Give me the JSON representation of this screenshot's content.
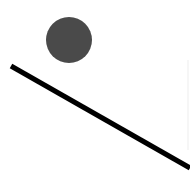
{
  "diagram": {
    "type": "ball-on-incline",
    "width": 190,
    "height": 195,
    "background": "#ffffff",
    "ball": {
      "cx": 69,
      "cy": 40,
      "r": 23,
      "color": "#4a4a4a"
    },
    "incline": {
      "x1": 11,
      "y1": 66,
      "x2": 190,
      "y2": 168,
      "stroke": "#000000",
      "stroke_width": 5
    },
    "edge_mark": {
      "x": 188,
      "y1": 60,
      "y2": 150,
      "stroke": "#ededed",
      "stroke_width": 1
    }
  }
}
